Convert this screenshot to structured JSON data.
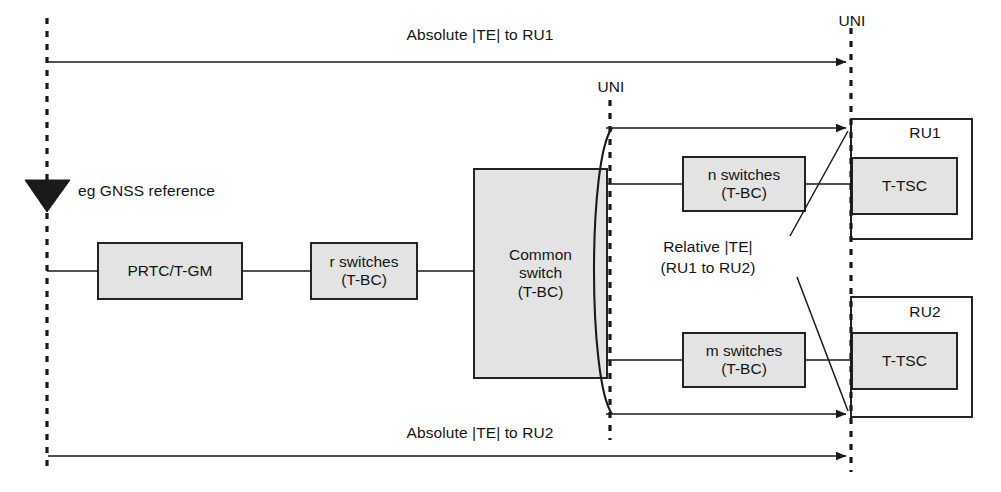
{
  "diagram": {
    "nodes": {
      "gnss_label": "eg GNSS reference",
      "prtc": "PRTC/T-GM",
      "r_switches_line1": "r switches",
      "r_switches_line2": "(T-BC)",
      "common_switch_line1": "Common",
      "common_switch_line2": "switch",
      "common_switch_line3": "(T-BC)",
      "n_switches_line1": "n switches",
      "n_switches_line2": "(T-BC)",
      "m_switches_line1": "m switches",
      "m_switches_line2": "(T-BC)",
      "ru1": "RU1",
      "ru2": "RU2",
      "ttsc_ru1": "T-TSC",
      "ttsc_ru2": "T-TSC"
    },
    "annotations": {
      "absolute_te_ru1": "Absolute |TE| to RU1",
      "absolute_te_ru2": "Absolute |TE| to RU2",
      "relative_te_line1": "Relative |TE|",
      "relative_te_line2": "(RU1 to RU2)",
      "uni_top": "UNI",
      "uni_mid": "UNI"
    },
    "icons": {
      "antenna": "gnss-antenna-icon"
    },
    "colors": {
      "box_fill": "#e3e3e3",
      "stroke": "#1a1a1a",
      "background": "#ffffff",
      "text": "#141414"
    }
  }
}
